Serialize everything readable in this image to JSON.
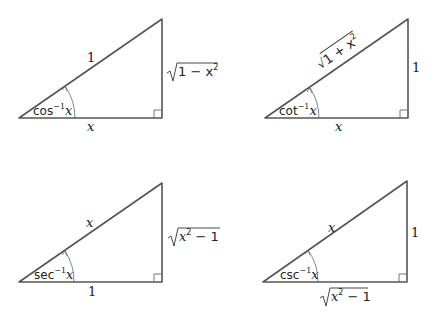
{
  "figure": {
    "stroke_color": "#555555",
    "triangles": [
      {
        "id": "arccos",
        "vertices": {
          "angle": [
            19,
            118
          ],
          "top": [
            162,
            19
          ],
          "right": [
            162,
            118
          ]
        },
        "hypotenuse_label": "1",
        "adjacent_label": "x",
        "opposite_label": "1 − x",
        "opposite_label_has_sqrt": true,
        "opposite_label_exponent": "2",
        "angle_label_fn": "cos",
        "angle_label_exp": "−1",
        "angle_label_var": "x"
      },
      {
        "id": "arccot",
        "vertices": {
          "angle": [
            265,
            118
          ],
          "top": [
            408,
            19
          ],
          "right": [
            408,
            118
          ]
        },
        "hypotenuse_label": "1 + x",
        "hypotenuse_label_has_sqrt": true,
        "hypotenuse_label_exponent": "2",
        "adjacent_label": "x",
        "opposite_label": "1",
        "angle_label_fn": "cot",
        "angle_label_exp": "−1",
        "angle_label_var": "x"
      },
      {
        "id": "arcsec",
        "vertices": {
          "angle": [
            19,
            282
          ],
          "top": [
            162,
            183
          ],
          "right": [
            162,
            282
          ]
        },
        "hypotenuse_label": "x",
        "adjacent_label": "1",
        "opposite_label_var": "x",
        "opposite_label_exponent": "2",
        "opposite_label_rest": " − 1",
        "opposite_label_has_sqrt": true,
        "angle_label_fn": "sec",
        "angle_label_exp": "−1",
        "angle_label_var": "x"
      },
      {
        "id": "arccsc",
        "vertices": {
          "angle": [
            263,
            282
          ],
          "top": [
            407,
            181
          ],
          "right": [
            407,
            282
          ]
        },
        "hypotenuse_label": "x",
        "adjacent_label_var": "x",
        "adjacent_label_exponent": "2",
        "adjacent_label_rest": " − 1",
        "adjacent_label_has_sqrt": true,
        "opposite_label": "1",
        "angle_label_fn": "csc",
        "angle_label_exp": "−1",
        "angle_label_var": "x"
      }
    ]
  }
}
